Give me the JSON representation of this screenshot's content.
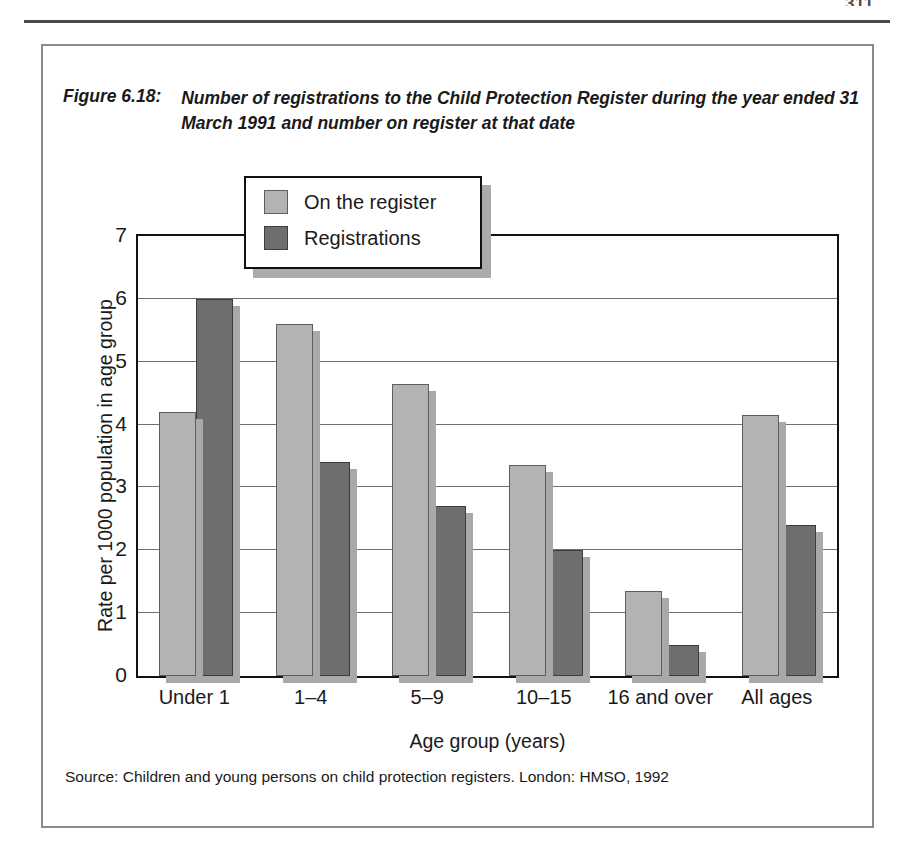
{
  "page": {
    "number": "311"
  },
  "figure": {
    "label": "Figure 6.18:",
    "caption": "Number of registrations to the Child Protection Register during the year ended 31 March 1991 and number on register at that date",
    "source": "Source: Children and young persons on child protection registers. London: HMSO, 1992"
  },
  "colors": {
    "series_on_register": "#b3b3b3",
    "series_registrations": "#6e6e6e",
    "bar_outline": "#5e5e5e",
    "shadow": "#a9a9a9",
    "frame": "#111111",
    "gridline": "#6f6f6f"
  },
  "chart_data": {
    "type": "bar",
    "title": "Number of registrations to the Child Protection Register during the year ended 31 March 1991 and number on register at that date",
    "xlabel": "Age group (years)",
    "ylabel": "Rate per 1000 population in age group",
    "ylim": [
      0,
      7
    ],
    "yticks": [
      0,
      1,
      2,
      3,
      4,
      5,
      6,
      7
    ],
    "ytick_labels": [
      "0",
      "1",
      "2",
      "3",
      "4",
      "5",
      "6",
      "7"
    ],
    "grid": true,
    "legend_position": "upper-center",
    "categories": [
      "Under 1",
      "1–4",
      "5–9",
      "10–15",
      "16 and over",
      "All ages"
    ],
    "series": [
      {
        "name": "On the register",
        "color": "#b3b3b3",
        "values": [
          4.2,
          5.6,
          4.65,
          3.35,
          1.35,
          4.15
        ]
      },
      {
        "name": "Registrations",
        "color": "#6e6e6e",
        "values": [
          6.0,
          3.4,
          2.7,
          2.0,
          0.5,
          2.4
        ]
      }
    ]
  }
}
